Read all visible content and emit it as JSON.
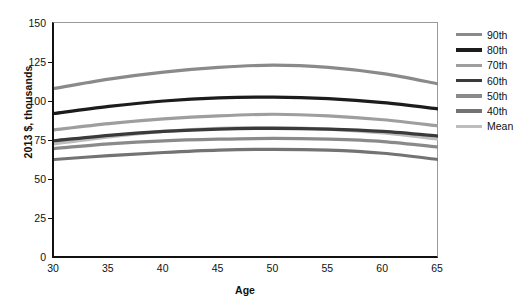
{
  "chart_data": {
    "type": "line",
    "title": "",
    "xlabel": "Age",
    "ylabel": "2013 $, thousands",
    "xlim": [
      30,
      65
    ],
    "ylim": [
      0,
      150
    ],
    "xticks": [
      30,
      35,
      40,
      45,
      50,
      55,
      60,
      65
    ],
    "yticks": [
      0,
      25,
      50,
      75,
      100,
      125,
      150
    ],
    "grid": false,
    "legend_position": "right",
    "x": [
      30,
      35,
      40,
      45,
      50,
      55,
      60,
      65
    ],
    "series": [
      {
        "name": "90th",
        "color": "#8a8a8a",
        "values": [
          108,
          114,
          118.5,
          121.5,
          123,
          121.5,
          117.5,
          111
        ]
      },
      {
        "name": "80th",
        "color": "#1c1c1c",
        "values": [
          92,
          96.5,
          100,
          102,
          102.5,
          101.5,
          99,
          95
        ]
      },
      {
        "name": "70th",
        "color": "#9e9e9e",
        "values": [
          81.5,
          85.5,
          88.5,
          90.5,
          91.5,
          90.5,
          88,
          84
        ]
      },
      {
        "name": "60th",
        "color": "#3a3a3a",
        "values": [
          74.5,
          78,
          80.5,
          82,
          82.5,
          82,
          80.5,
          77.5
        ]
      },
      {
        "name": "50th",
        "color": "#8a8a8a",
        "values": [
          69.5,
          72.5,
          74.5,
          75.5,
          76,
          75.5,
          74,
          70.5
        ]
      },
      {
        "name": "40th",
        "color": "#737373",
        "values": [
          62.5,
          65,
          67,
          68.5,
          69,
          68.5,
          66.5,
          62.5
        ]
      },
      {
        "name": "Mean",
        "color": "#bdbdbd",
        "values": [
          72.5,
          77,
          80.5,
          82.5,
          83,
          82,
          79.5,
          75.5
        ]
      }
    ],
    "legend": [
      "90th",
      "80th",
      "70th",
      "60th",
      "50th",
      "40th",
      "Mean"
    ]
  }
}
